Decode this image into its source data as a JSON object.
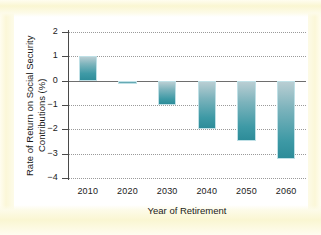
{
  "chart_data": {
    "type": "bar",
    "title": "",
    "subtitle": "",
    "xlabel": "Year of Retirement",
    "ylabel_line1": "Rate of Return on Social Security",
    "ylabel_line2": "Contributions (%)",
    "ylabel": "Rate of Return on Social Security Contributions (%)",
    "categories": [
      "2010",
      "2020",
      "2030",
      "2040",
      "2050",
      "2060"
    ],
    "values": [
      1.0,
      -0.15,
      -1.0,
      -2.0,
      -2.5,
      -3.2
    ],
    "series": [
      {
        "name": "Rate of Return on Social Security Contributions (%)",
        "values": [
          1.0,
          -0.15,
          -1.0,
          -2.0,
          -2.5,
          -3.2
        ]
      }
    ],
    "ylim": [
      -4,
      2
    ],
    "ytick_values": [
      2,
      1,
      0,
      -1,
      -2,
      -3,
      -4
    ],
    "ytick_labels": [
      "2",
      "1",
      "0",
      "−1",
      "−2",
      "−3",
      "−4"
    ],
    "grid": true,
    "grid_axis": "y",
    "grid_style": "dotted",
    "legend": false,
    "legend_position": "none",
    "bar_color": "#3f9aa6",
    "bar_color_top": "#b7cdd2",
    "zero_line_color": "#6e6e6e",
    "axis_color": "#4a4a4a",
    "grid_color": "#9a9a9a",
    "plot_background": "#ffffff",
    "figure_background": "#fdfbe8"
  },
  "figure": {
    "background_frame_color": "#fbf7d8"
  }
}
